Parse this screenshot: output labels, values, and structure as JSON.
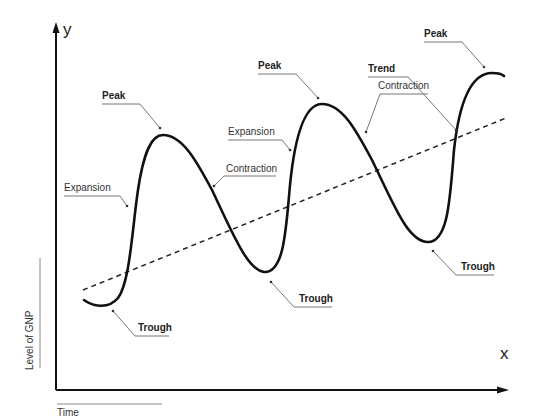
{
  "diagram": {
    "axes": {
      "y_letter": "y",
      "x_letter": "x",
      "y_label": "Level of GNP",
      "x_label": "Time"
    },
    "labels": {
      "peak_1": "Peak",
      "peak_2": "Peak",
      "peak_3": "Peak",
      "trough_1": "Trough",
      "trough_2": "Trough",
      "trough_3": "Trough",
      "expansion_1": "Expansion",
      "expansion_2": "Expansion",
      "contraction_1": "Contraction",
      "contraction_2": "Contraction",
      "trend": "Trend"
    },
    "colors": {
      "curve": "#111111",
      "trend_line": "#222222",
      "leader_line": "#777777",
      "axis": "#111111"
    }
  }
}
